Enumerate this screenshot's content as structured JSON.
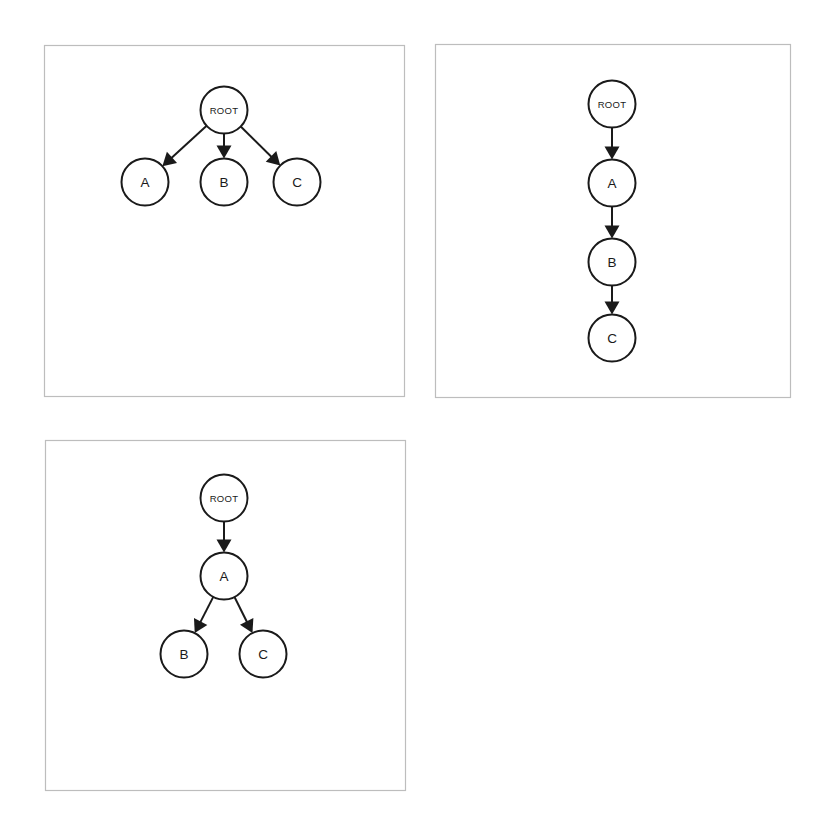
{
  "canvas": {
    "width": 829,
    "height": 819,
    "background": "#ffffff"
  },
  "style": {
    "panel_border_color": "#bdbdbd",
    "node_stroke_color": "#1a1a1a",
    "node_fill_color": "#ffffff",
    "edge_color": "#1a1a1a",
    "label_color": "#1a1a1a",
    "node_radius": 23.5
  },
  "panels": [
    {
      "id": "panel-1",
      "name": "root-with-three-children",
      "frame": {
        "x": 44,
        "y": 45,
        "width": 360,
        "height": 351
      },
      "nodes": [
        {
          "id": "ROOT",
          "label": "ROOT",
          "label_size": "small",
          "cx": 224,
          "cy": 110
        },
        {
          "id": "A",
          "label": "A",
          "label_size": "big",
          "cx": 145,
          "cy": 182
        },
        {
          "id": "B",
          "label": "B",
          "label_size": "big",
          "cx": 224,
          "cy": 182
        },
        {
          "id": "C",
          "label": "C",
          "label_size": "big",
          "cx": 297,
          "cy": 182
        }
      ],
      "edges": [
        {
          "from": "ROOT",
          "to": "A"
        },
        {
          "from": "ROOT",
          "to": "B"
        },
        {
          "from": "ROOT",
          "to": "C"
        }
      ]
    },
    {
      "id": "panel-2",
      "name": "root-linear-chain",
      "frame": {
        "x": 435,
        "y": 44,
        "width": 355,
        "height": 353
      },
      "nodes": [
        {
          "id": "ROOT",
          "label": "ROOT",
          "label_size": "small",
          "cx": 612,
          "cy": 104
        },
        {
          "id": "A",
          "label": "A",
          "label_size": "big",
          "cx": 612,
          "cy": 183
        },
        {
          "id": "B",
          "label": "B",
          "label_size": "big",
          "cx": 612,
          "cy": 262
        },
        {
          "id": "C",
          "label": "C",
          "label_size": "big",
          "cx": 612,
          "cy": 338
        }
      ],
      "edges": [
        {
          "from": "ROOT",
          "to": "A"
        },
        {
          "from": "A",
          "to": "B"
        },
        {
          "from": "B",
          "to": "C"
        }
      ]
    },
    {
      "id": "panel-3",
      "name": "root-then-binary-split",
      "frame": {
        "x": 45,
        "y": 440,
        "width": 360,
        "height": 350
      },
      "nodes": [
        {
          "id": "ROOT",
          "label": "ROOT",
          "label_size": "small",
          "cx": 224,
          "cy": 498
        },
        {
          "id": "A",
          "label": "A",
          "label_size": "big",
          "cx": 224,
          "cy": 576
        },
        {
          "id": "B",
          "label": "B",
          "label_size": "big",
          "cx": 184,
          "cy": 654
        },
        {
          "id": "C",
          "label": "C",
          "label_size": "big",
          "cx": 263,
          "cy": 654
        }
      ],
      "edges": [
        {
          "from": "ROOT",
          "to": "A"
        },
        {
          "from": "A",
          "to": "B"
        },
        {
          "from": "A",
          "to": "C"
        }
      ]
    }
  ]
}
